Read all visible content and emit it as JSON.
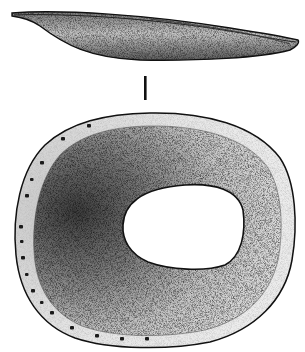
{
  "figure": {
    "kind": "archaeological line drawing",
    "views": [
      {
        "id": "side-profile",
        "label": ""
      },
      {
        "id": "plan-view",
        "label": ""
      }
    ],
    "scale_bar": {
      "label": ""
    },
    "perforation_count": 16,
    "colors": {
      "ink": "#111111",
      "paper": "#ffffff",
      "stipple_dark": "#3a3a3a",
      "stipple_mid": "#8a8a8a",
      "stipple_light": "#d8d8d8"
    }
  }
}
